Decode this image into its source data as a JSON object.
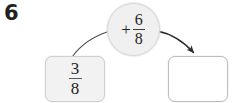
{
  "problem": {
    "number": "6",
    "type": "fraction-addition-flow-diagram"
  },
  "input_box": {
    "name": "input-fraction",
    "numerator": "3",
    "denominator": "8",
    "fill_color": "#f2f2f2",
    "border_color": "#cfcfcf"
  },
  "operator_bubble": {
    "name": "operation",
    "symbol": "+",
    "numerator": "6",
    "denominator": "8",
    "fill_color": "#f0f0f0",
    "border_color": "#d8d8d8"
  },
  "answer_box": {
    "name": "answer-blank",
    "value": "",
    "fill_color": "#ffffff",
    "border_color": "#bdbdbd"
  },
  "connectors": {
    "input_to_operator": {
      "name": "curve-input-to-operator",
      "has_arrowhead": false,
      "color": "#4a4a4a"
    },
    "operator_to_answer": {
      "name": "arrow-operator-to-answer",
      "has_arrowhead": true,
      "color": "#2b2b2b"
    }
  }
}
